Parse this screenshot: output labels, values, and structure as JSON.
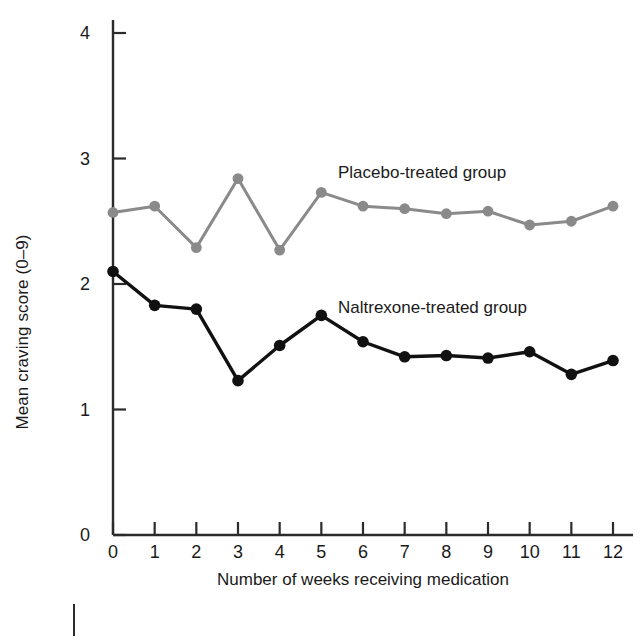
{
  "chart_data": {
    "type": "line",
    "title": "",
    "xlabel": "Number of weeks receiving medication",
    "ylabel": "Mean craving score (0–9)",
    "x": [
      0,
      1,
      2,
      3,
      4,
      5,
      6,
      7,
      8,
      9,
      10,
      11,
      12
    ],
    "categories": [
      "0",
      "1",
      "2",
      "3",
      "4",
      "5",
      "6",
      "7",
      "8",
      "9",
      "10",
      "11",
      "12"
    ],
    "xlim": [
      0,
      12
    ],
    "ylim": [
      0,
      4.2
    ],
    "xticks": [
      0,
      1,
      2,
      3,
      4,
      5,
      6,
      7,
      8,
      9,
      10,
      11,
      12
    ],
    "yticks": [
      0,
      1,
      2,
      3,
      4
    ],
    "ytick_labels": [
      "0",
      "1",
      "2",
      "3",
      "4"
    ],
    "grid": false,
    "legend_position": "inline-annotation",
    "series": [
      {
        "name": "Placebo-treated group",
        "color": "#8a8a8a",
        "marker": "circle",
        "values": [
          2.57,
          2.62,
          2.29,
          2.84,
          2.27,
          2.73,
          2.62,
          2.6,
          2.56,
          2.58,
          2.47,
          2.5,
          2.62
        ]
      },
      {
        "name": "Naltrexone-treated group",
        "color": "#111111",
        "marker": "circle",
        "values": [
          2.1,
          1.83,
          1.8,
          1.23,
          1.51,
          1.75,
          1.54,
          1.42,
          1.43,
          1.41,
          1.46,
          1.28,
          1.39
        ]
      }
    ],
    "annotations": [
      {
        "text": "Placebo-treated group",
        "x": 5.4,
        "y": 2.95
      },
      {
        "text": "Naltrexone-treated group",
        "x": 5.4,
        "y": 1.88
      }
    ]
  },
  "axis": {
    "ytick_labels": [
      "4",
      "3",
      "2",
      "1",
      "0"
    ],
    "xtick_labels": [
      "0",
      "1",
      "2",
      "3",
      "4",
      "5",
      "6",
      "7",
      "8",
      "9",
      "10",
      "11",
      "12"
    ],
    "x_title": "Number of weeks receiving medication",
    "y_title": "Mean craving score (0–9)"
  },
  "colors": {
    "placebo": "#8a8a8a",
    "naltrexone": "#111111",
    "axis": "#2b2b2b",
    "background": "#ffffff"
  }
}
